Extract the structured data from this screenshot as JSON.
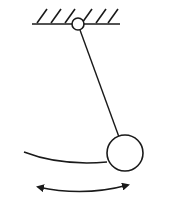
{
  "diagram": {
    "type": "simple-pendulum",
    "colors": {
      "stroke": "#1a1a1a",
      "background": "#ffffff"
    },
    "ceiling": {
      "x1": 32,
      "x2": 120,
      "y": 24,
      "hatch_count": 6
    },
    "pivot": {
      "cx": 78,
      "cy": 24,
      "r": 6
    },
    "rod": {
      "x1": 80,
      "y1": 30,
      "x2": 119,
      "y2": 137
    },
    "bob": {
      "cx": 125,
      "cy": 153,
      "r": 18
    },
    "swing_arc": {
      "d": "M24,152 Q60,166 107,162"
    },
    "motion_arrow": {
      "d": "M38,187 Q84,197 128,185"
    }
  }
}
